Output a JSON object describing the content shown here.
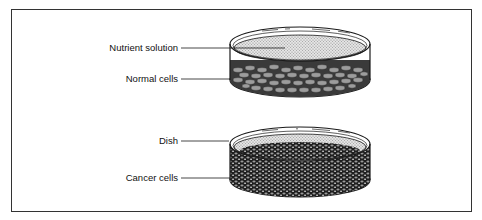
{
  "figure": {
    "type": "labeled scientific illustration",
    "dishes": [
      {
        "id": "top-dish",
        "content": "normal cells",
        "description": "Single sparse layer of cells at the bottom, covered by nutrient solution",
        "labels": [
          {
            "text": "Nutrient solution"
          },
          {
            "text": "Normal cells"
          }
        ]
      },
      {
        "id": "bottom-dish",
        "content": "cancer cells",
        "description": "Dense, piled-up cell mass filling the dish",
        "labels": [
          {
            "text": "Dish"
          },
          {
            "text": "Cancer cells"
          }
        ]
      }
    ]
  },
  "labels": {
    "nutrient_solution": "Nutrient solution",
    "normal_cells": "Normal cells",
    "dish": "Dish",
    "cancer_cells": "Cancer cells"
  },
  "colors": {
    "line": "#1a1a1a",
    "solution_fill": "#cfcfcf",
    "normal_cell": "#8a8a8a",
    "cancer_cell": "#2a2a2a",
    "background": "#ffffff"
  }
}
